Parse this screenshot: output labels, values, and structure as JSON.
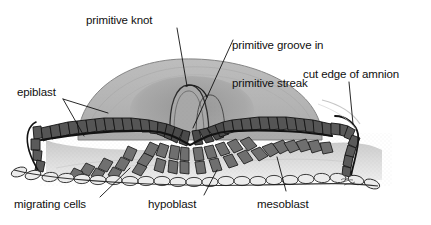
{
  "figure": {
    "background_color": "#ffffff",
    "ink_color": "#101010",
    "width": 431,
    "height": 225
  },
  "palette": {
    "amnion_fill": "#b3b3b3",
    "amnion_fill_light": "#c4c4c4",
    "amnion_edge": "#6e6e6e",
    "epiblast_cell": "#555555",
    "epiblast_cell_dark": "#3a3a3a",
    "epiblast_outline": "#1c1c1c",
    "mesoblast_cell": "#6a6a6a",
    "hypoblast_cell": "#e8e8e8",
    "hypoblast_outline": "#303030",
    "interior_stipple": "#d6d6d6",
    "leader_line": "#111111"
  },
  "labels": [
    {
      "id": "primitive-knot",
      "text": "primitive knot",
      "x": 86,
      "y": 14,
      "align": "left",
      "leaders": [
        {
          "points": "177,28 186,84"
        }
      ]
    },
    {
      "id": "primitive-groove",
      "text": "primitive groove in\nprimitive streak",
      "line1": "primitive groove in",
      "line2": "primitive streak",
      "x": 232,
      "y": 14,
      "align": "left",
      "leaders": [
        {
          "points": "232,40 193,127"
        }
      ]
    },
    {
      "id": "epiblast",
      "text": "epiblast",
      "x": 17,
      "y": 86,
      "align": "left",
      "leaders": [
        {
          "points": "62,99 106,113"
        },
        {
          "points": "62,99 82,133"
        }
      ]
    },
    {
      "id": "cut-edge-of-amnion",
      "text": "cut edge of amnion",
      "x": 303,
      "y": 68,
      "align": "left",
      "leaders": [
        {
          "points": "349,82 352,122"
        }
      ]
    },
    {
      "id": "migrating-cells",
      "text": "migrating cells",
      "x": 14,
      "y": 198,
      "align": "left",
      "leaders": [
        {
          "points": "99,198 128,170"
        }
      ]
    },
    {
      "id": "hypoblast",
      "text": "hypoblast",
      "x": 148,
      "y": 198,
      "align": "left",
      "leaders": [
        {
          "points": "203,196 216,170"
        }
      ]
    },
    {
      "id": "mesoblast",
      "text": "mesoblast",
      "x": 257,
      "y": 198,
      "align": "left",
      "leaders": [
        {
          "points": "285,192 277,158"
        }
      ]
    }
  ],
  "structures": [
    {
      "id": "amnion-dome",
      "name": "amnion",
      "description": "large gray dome arching over the embryonic disc"
    },
    {
      "id": "primitive-knot-mound",
      "name": "primitive knot",
      "description": "raised mound at the crest of the dome"
    },
    {
      "id": "primitive-groove",
      "name": "primitive groove",
      "description": "depression running along the primitive streak"
    },
    {
      "id": "epiblast-layer",
      "name": "epiblast",
      "description": "dark columnar epithelial cell layer forming the upper sheet"
    },
    {
      "id": "hypoblast-layer",
      "name": "hypoblast",
      "description": "pale flattened cell layer forming the lower sheet"
    },
    {
      "id": "mesoblast-cells",
      "name": "mesoblast",
      "description": "cells streaming between epiblast and hypoblast"
    },
    {
      "id": "migrating-cells",
      "name": "migrating cells",
      "description": "chains of cells moving laterally from the streak"
    },
    {
      "id": "cut-edge-amnion",
      "name": "cut edge of amnion",
      "description": "severed amnion margin turning down at the right"
    }
  ],
  "signature": {
    "present": true,
    "description": "artist initials near lower right of the drawing"
  }
}
